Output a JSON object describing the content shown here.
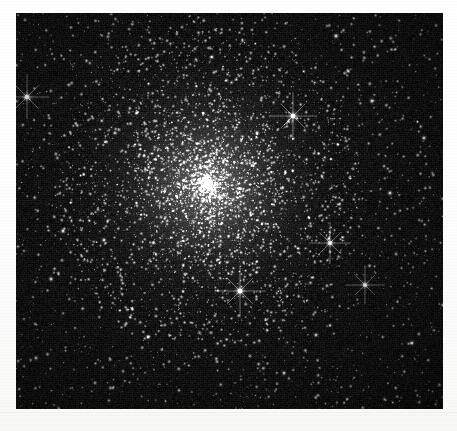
{
  "image": {
    "kind": "astronomical-photograph",
    "subject": "globular-star-cluster",
    "caption": "",
    "background_color": "#ffffff",
    "plate_color": "#000000",
    "star_color": "#ffffff",
    "plate": {
      "x": 16,
      "y": 13,
      "width": 427,
      "height": 396
    },
    "canvas": {
      "width": 427,
      "height": 396
    }
  },
  "chart_data": {
    "type": "scatter",
    "title": "",
    "xlabel": "",
    "ylabel": "",
    "xlim": [
      0,
      427
    ],
    "ylim": [
      0,
      396
    ],
    "grid": false,
    "legend": null,
    "background": "#000000",
    "point_color": "#ffffff",
    "cluster": {
      "core_center": [
        192,
        172
      ],
      "core_radius": 56,
      "halo_radius": 150,
      "core_density_peak": 1.0,
      "falloff": "king-profile",
      "core_star_count": 2600,
      "halo_star_count": 2200,
      "field_star_count": 2400
    },
    "bright_stars": [
      {
        "x": 11,
        "y": 84,
        "r": 3.0,
        "brightness": 0.95,
        "spikes": true,
        "label": ""
      },
      {
        "x": 277,
        "y": 103,
        "r": 3.2,
        "brightness": 1.0,
        "spikes": true,
        "label": ""
      },
      {
        "x": 224,
        "y": 278,
        "r": 3.4,
        "brightness": 1.0,
        "spikes": true,
        "label": ""
      },
      {
        "x": 314,
        "y": 230,
        "r": 2.8,
        "brightness": 0.9,
        "spikes": true,
        "label": ""
      },
      {
        "x": 349,
        "y": 272,
        "r": 2.6,
        "brightness": 0.86,
        "spikes": true,
        "label": ""
      },
      {
        "x": 320,
        "y": 23,
        "r": 2.6,
        "brightness": 0.88,
        "spikes": false,
        "label": ""
      },
      {
        "x": 356,
        "y": 88,
        "r": 2.5,
        "brightness": 0.84,
        "spikes": false,
        "label": ""
      },
      {
        "x": 408,
        "y": 125,
        "r": 2.4,
        "brightness": 0.82,
        "spikes": false,
        "label": ""
      },
      {
        "x": 374,
        "y": 180,
        "r": 2.4,
        "brightness": 0.82,
        "spikes": false,
        "label": ""
      },
      {
        "x": 47,
        "y": 218,
        "r": 2.5,
        "brightness": 0.84,
        "spikes": false,
        "label": ""
      },
      {
        "x": 35,
        "y": 266,
        "r": 2.4,
        "brightness": 0.8,
        "spikes": false,
        "label": ""
      },
      {
        "x": 88,
        "y": 227,
        "r": 2.3,
        "brightness": 0.78,
        "spikes": false,
        "label": ""
      },
      {
        "x": 132,
        "y": 324,
        "r": 2.4,
        "brightness": 0.8,
        "spikes": false,
        "label": ""
      },
      {
        "x": 268,
        "y": 360,
        "r": 2.3,
        "brightness": 0.78,
        "spikes": false,
        "label": ""
      },
      {
        "x": 300,
        "y": 322,
        "r": 2.3,
        "brightness": 0.76,
        "spikes": false,
        "label": ""
      },
      {
        "x": 396,
        "y": 330,
        "r": 2.3,
        "brightness": 0.78,
        "spikes": false,
        "label": ""
      },
      {
        "x": 20,
        "y": 345,
        "r": 2.2,
        "brightness": 0.74,
        "spikes": false,
        "label": ""
      },
      {
        "x": 196,
        "y": 44,
        "r": 2.2,
        "brightness": 0.74,
        "spikes": false,
        "label": ""
      },
      {
        "x": 99,
        "y": 120,
        "r": 2.2,
        "brightness": 0.74,
        "spikes": false,
        "label": ""
      },
      {
        "x": 241,
        "y": 120,
        "r": 2.3,
        "brightness": 0.8,
        "spikes": false,
        "label": ""
      }
    ]
  }
}
